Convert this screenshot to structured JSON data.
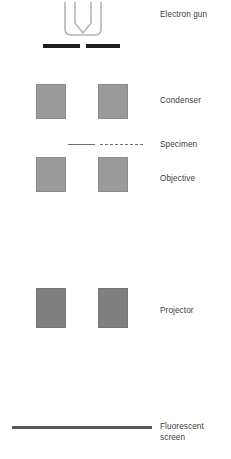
{
  "diagram": {
    "labels": {
      "electron_gun": "Electron gun",
      "condenser": "Condenser",
      "specimen": "Specimen",
      "objective": "Objective",
      "projector": "Projector",
      "fluorescent_screen": "Fluorescent\nscreen"
    },
    "colors": {
      "lens_fill": "#9a9a9a",
      "lens_border": "#8c8c8c",
      "projector_fill": "#7f7f7f",
      "projector_border": "#757575",
      "anode_bar": "#1d1d1d",
      "specimen_line": "#6e6e6e",
      "screen_line": "#575757",
      "gun_stroke": "#b4b4b4",
      "label_text": "#3c3c3c",
      "background": "#ffffff"
    },
    "components": [
      {
        "name": "electron-gun",
        "kind": "filament",
        "label": "Electron gun"
      },
      {
        "name": "anode-plates",
        "kind": "bar-pair",
        "label": ""
      },
      {
        "name": "condenser-lenses",
        "kind": "lens-pair",
        "label": "Condenser"
      },
      {
        "name": "specimen-plane",
        "kind": "line-pair",
        "label": "Specimen"
      },
      {
        "name": "objective-lenses",
        "kind": "lens-pair",
        "label": "Objective"
      },
      {
        "name": "projector-lenses",
        "kind": "lens-pair",
        "label": "Projector"
      },
      {
        "name": "fluorescent-screen",
        "kind": "line",
        "label": "Fluorescent screen"
      }
    ]
  }
}
